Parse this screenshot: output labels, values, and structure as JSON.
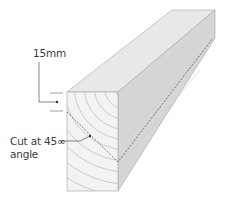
{
  "diagram": {
    "labels": {
      "offset": "15mm",
      "cut_line1": "Cut at 45∞",
      "cut_line2": "angle"
    },
    "colors": {
      "top_face": "#e6e6e6",
      "front_face": "#f4f4f4",
      "side_face": "#d4d4d4",
      "grain": "#c4c4c4",
      "outline": "#9a9a9a",
      "leader": "#555555",
      "cut_line": "#555555"
    }
  }
}
